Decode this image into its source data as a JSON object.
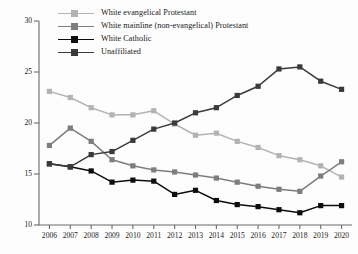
{
  "chart_data": {
    "type": "line",
    "title": "",
    "subtitle": "",
    "xlabel": "",
    "ylabel": "",
    "x": [
      2006,
      2007,
      2008,
      2009,
      2010,
      2011,
      2012,
      2013,
      2014,
      2015,
      2016,
      2017,
      2018,
      2019,
      2020
    ],
    "xticklabels": [
      "2006",
      "2007",
      "2008",
      "2009",
      "2010",
      "2011",
      "2012",
      "2013",
      "2014",
      "2015",
      "2016",
      "2017",
      "2018",
      "2019",
      "2020"
    ],
    "yticklabels": [
      "10",
      "15",
      "20",
      "25",
      "30"
    ],
    "yticks": [
      10,
      15,
      20,
      25,
      30
    ],
    "xlim": [
      2005.5,
      2020.5
    ],
    "ylim": [
      10,
      30
    ],
    "grid": false,
    "legend_position": "top-left",
    "series": [
      {
        "name": "White evangelical Protestant",
        "color": "#b3b3b3",
        "marker": "square",
        "values": [
          23.1,
          22.5,
          21.5,
          20.8,
          20.8,
          21.2,
          19.9,
          18.8,
          19.0,
          18.2,
          17.6,
          16.8,
          16.4,
          15.8,
          14.7
        ]
      },
      {
        "name": "White mainline (non-evangelical) Protestant",
        "color": "#7d7d7d",
        "marker": "square",
        "values": [
          17.8,
          19.5,
          18.2,
          16.4,
          15.8,
          15.4,
          15.2,
          14.9,
          14.6,
          14.2,
          13.8,
          13.5,
          13.3,
          14.8,
          16.2
        ]
      },
      {
        "name": "White Catholic",
        "color": "#0d0d0d",
        "marker": "square",
        "values": [
          16.0,
          15.7,
          15.3,
          14.2,
          14.4,
          14.3,
          13.0,
          13.4,
          12.4,
          12.0,
          11.8,
          11.5,
          11.2,
          11.9,
          11.9
        ]
      },
      {
        "name": "Unaffiliated",
        "color": "#3a3a3a",
        "marker": "square",
        "values": [
          16.0,
          15.7,
          16.9,
          17.2,
          18.3,
          19.4,
          20.0,
          21.0,
          21.5,
          22.7,
          23.6,
          25.3,
          25.5,
          24.1,
          23.3
        ]
      }
    ]
  },
  "legend": {
    "items": [
      {
        "label": "White evangelical Protestant",
        "color": "#b3b3b3"
      },
      {
        "label": "White mainline (non-evangelical) Protestant",
        "color": "#7d7d7d"
      },
      {
        "label": "White Catholic",
        "color": "#0d0d0d"
      },
      {
        "label": "Unaffiliated",
        "color": "#3a3a3a"
      }
    ]
  },
  "axes": {
    "axis_color": "#6b6b6b"
  }
}
